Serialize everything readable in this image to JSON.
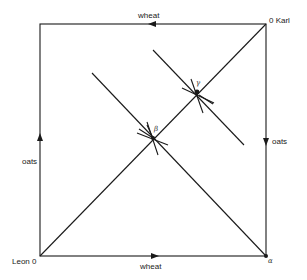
{
  "diagram": {
    "type": "edgeworth-box",
    "colors": {
      "line": "#1a1a1a",
      "background": "#ffffff"
    },
    "labels": {
      "origin_bottom_left": "Leon 0",
      "origin_top_right": "0 Karl",
      "axis_bottom": "wheat",
      "axis_top": "wheat",
      "axis_left": "oats",
      "axis_right": "oats",
      "point_alpha": "α",
      "point_beta": "β",
      "point_gamma": "γ"
    }
  }
}
